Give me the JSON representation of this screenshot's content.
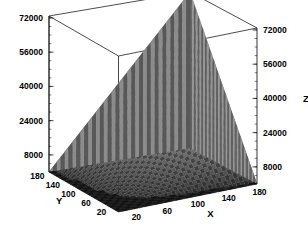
{
  "chart_data": {
    "type": "surface",
    "title": "",
    "xlabel": "X",
    "ylabel": "Y",
    "zlabel": "Z",
    "xlim": [
      0,
      180
    ],
    "ylim": [
      0,
      180
    ],
    "zlim": [
      0,
      72900
    ],
    "xticks": [
      20,
      60,
      100,
      140,
      180
    ],
    "yticks": [
      180,
      140,
      100,
      60,
      20
    ],
    "zticks": [
      8000,
      24000,
      40000,
      56000,
      72000
    ],
    "xtick_labels": [
      "20",
      "60",
      "100",
      "140",
      "180"
    ],
    "ytick_labels": [
      "180",
      "140",
      "100",
      "60",
      "20"
    ],
    "ztick_labels_left": [
      "8000",
      "24000",
      "40000",
      "56000",
      "72000"
    ],
    "ztick_labels_right": [
      "8000",
      "24000",
      "40000",
      "56000",
      "72000"
    ],
    "grid": false,
    "legend": null,
    "colormap": "grayscale",
    "mesh": true,
    "surface_description": "z increases as product of x and y; flat dark plateau near origin rising to sharp peak at maximum x and y",
    "z_formula": "z = 2.25 * x * y",
    "z_max": 72900,
    "z_min": 0,
    "grid_steps": 36,
    "series": [
      {
        "name": "surface",
        "x": [
          0,
          20,
          40,
          60,
          80,
          100,
          120,
          140,
          160,
          180
        ],
        "y": [
          0,
          20,
          40,
          60,
          80,
          100,
          120,
          140,
          160,
          180
        ],
        "z": [
          [
            0,
            0,
            0,
            0,
            0,
            0,
            0,
            0,
            0,
            0
          ],
          [
            0,
            900,
            1800,
            2700,
            3600,
            4500,
            5400,
            6300,
            7200,
            8100
          ],
          [
            0,
            1800,
            3600,
            5400,
            7200,
            9000,
            10800,
            12600,
            14400,
            16200
          ],
          [
            0,
            2700,
            5400,
            8100,
            10800,
            13500,
            16200,
            18900,
            21600,
            24300
          ],
          [
            0,
            3600,
            7200,
            10800,
            14400,
            18000,
            21600,
            25200,
            28800,
            32400
          ],
          [
            0,
            4500,
            9000,
            13500,
            18000,
            22500,
            27000,
            31500,
            36000,
            40500
          ],
          [
            0,
            5400,
            10800,
            16200,
            21600,
            27000,
            32400,
            37800,
            43200,
            48600
          ],
          [
            0,
            6300,
            12600,
            18900,
            25200,
            31500,
            37800,
            44100,
            50400,
            56700
          ],
          [
            0,
            7200,
            14400,
            21600,
            28800,
            36000,
            43200,
            50400,
            57600,
            64800
          ],
          [
            0,
            8100,
            16200,
            24300,
            32400,
            40500,
            48600,
            56700,
            64800,
            72900
          ]
        ]
      }
    ]
  },
  "axes": {
    "x_title": "X",
    "y_title": "Y",
    "z_title": "Z"
  },
  "colors": {
    "background": "#ffffff",
    "frame": "#000000",
    "text": "#000000",
    "surface_light": "#d8d8d8",
    "surface_dark": "#1a1a1a"
  }
}
